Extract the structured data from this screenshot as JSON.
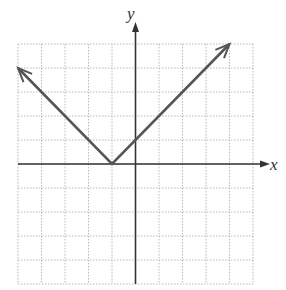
{
  "chart_data": {
    "type": "line",
    "title": "",
    "function": "y = |x + 1|",
    "xlabel": "x",
    "ylabel": "y",
    "xlim": [
      -5,
      5
    ],
    "ylim": [
      -5,
      5
    ],
    "grid": true,
    "grid_step": 1,
    "series": [
      {
        "name": "absolute value",
        "points": [
          [
            -5,
            4
          ],
          [
            -1,
            0
          ],
          [
            4,
            5
          ]
        ],
        "arrows": [
          "start",
          "end"
        ]
      }
    ],
    "vertex": [
      -1,
      0
    ]
  },
  "labels": {
    "x_axis": "x",
    "y_axis": "y"
  },
  "colors": {
    "grid": "#b8b8b8",
    "axis": "#333333",
    "curve": "#555555"
  }
}
